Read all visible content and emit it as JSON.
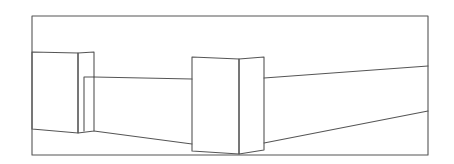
{
  "diagram": {
    "type": "line-drawing",
    "stroke_color": "#555555",
    "background": "#ffffff",
    "frame": {
      "x": 32,
      "y": 16,
      "width": 396,
      "height": 139
    },
    "left_block": {
      "front": [
        [
          32,
          52
        ],
        [
          78,
          53
        ],
        [
          78,
          133
        ],
        [
          32,
          129
        ]
      ],
      "side": [
        [
          78,
          53
        ],
        [
          94,
          52
        ],
        [
          94,
          131
        ],
        [
          78,
          133
        ]
      ],
      "inner_edge": [
        [
          84,
          77
        ],
        [
          84,
          131
        ]
      ]
    },
    "center_block": {
      "front": [
        [
          192,
          57
        ],
        [
          239,
          59
        ],
        [
          239,
          154
        ],
        [
          192,
          151
        ]
      ],
      "side": [
        [
          239,
          59
        ],
        [
          264,
          57
        ],
        [
          264,
          150
        ],
        [
          239,
          154
        ]
      ]
    },
    "back_wall": {
      "top": [
        [
          84,
          77
        ],
        [
          192,
          79
        ]
      ],
      "bottom": [
        [
          94,
          131
        ],
        [
          192,
          144
        ]
      ]
    },
    "right_wall": {
      "top": [
        [
          264,
          78
        ],
        [
          428,
          66
        ]
      ],
      "bottom": [
        [
          264,
          143
        ],
        [
          428,
          111
        ]
      ]
    }
  }
}
